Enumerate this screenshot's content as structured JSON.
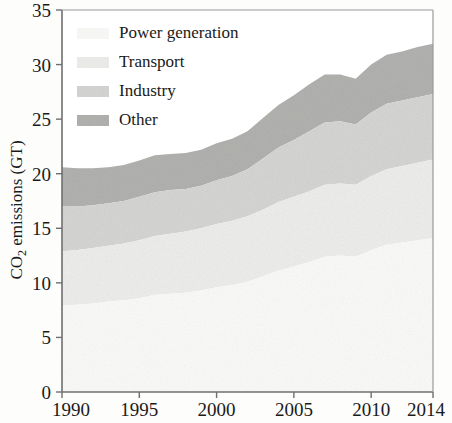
{
  "figure": {
    "background_color": "#fdfdfc",
    "frame_color": "#6f6f6f"
  },
  "axes": {
    "y_title": "CO",
    "y_title_sub": "2",
    "y_title_rest": " emissions (GT)",
    "y_title_full": "CO2 emissions (GT)",
    "y_ticks": [
      "0",
      "5",
      "10",
      "15",
      "20",
      "25",
      "30",
      "35"
    ],
    "x_ticks": [
      "1990",
      "1995",
      "2000",
      "2005",
      "2010",
      "2014"
    ]
  },
  "legend": {
    "items": [
      {
        "label": "Power generation",
        "color": "#fbfbfa"
      },
      {
        "label": "Transport",
        "color": "#eeeeec"
      },
      {
        "label": "Industry",
        "color": "#d6d6d4"
      },
      {
        "label": "Other",
        "color": "#b2b2b0"
      }
    ]
  },
  "chart_data": {
    "type": "area",
    "title": "",
    "xlabel": "",
    "ylabel": "CO2 emissions (GT)",
    "xlim": [
      1990,
      2014
    ],
    "ylim": [
      0,
      35
    ],
    "grid": false,
    "stacked": true,
    "legend_position": "upper-left",
    "x": [
      1990,
      1991,
      1992,
      1993,
      1994,
      1995,
      1996,
      1997,
      1998,
      1999,
      2000,
      2001,
      2002,
      2003,
      2004,
      2005,
      2006,
      2007,
      2008,
      2009,
      2010,
      2011,
      2012,
      2013,
      2014
    ],
    "series": [
      {
        "name": "Power generation",
        "color": "#fbfbfa",
        "values": [
          7.9,
          8.0,
          8.1,
          8.3,
          8.4,
          8.6,
          8.9,
          9.0,
          9.1,
          9.3,
          9.6,
          9.8,
          10.1,
          10.6,
          11.1,
          11.5,
          11.9,
          12.4,
          12.5,
          12.4,
          13.0,
          13.5,
          13.7,
          13.9,
          14.1
        ]
      },
      {
        "name": "Transport",
        "color": "#eeeeec",
        "values": [
          5.0,
          5.0,
          5.1,
          5.1,
          5.2,
          5.3,
          5.4,
          5.5,
          5.6,
          5.7,
          5.8,
          5.9,
          6.0,
          6.1,
          6.3,
          6.4,
          6.5,
          6.6,
          6.6,
          6.6,
          6.8,
          6.9,
          7.0,
          7.1,
          7.2
        ]
      },
      {
        "name": "Industry",
        "color": "#d6d6d4",
        "values": [
          4.1,
          4.0,
          3.9,
          3.9,
          3.9,
          4.0,
          4.0,
          4.0,
          3.9,
          3.9,
          4.0,
          4.1,
          4.3,
          4.7,
          5.0,
          5.2,
          5.5,
          5.7,
          5.7,
          5.5,
          5.8,
          6.0,
          6.0,
          6.0,
          6.0
        ]
      },
      {
        "name": "Other",
        "color": "#b2b2b0",
        "values": [
          3.6,
          3.5,
          3.4,
          3.3,
          3.3,
          3.3,
          3.4,
          3.3,
          3.3,
          3.3,
          3.4,
          3.4,
          3.5,
          3.7,
          3.9,
          4.1,
          4.3,
          4.4,
          4.3,
          4.2,
          4.4,
          4.5,
          4.5,
          4.6,
          4.6
        ]
      }
    ],
    "totals": [
      20.6,
      20.5,
      20.5,
      20.6,
      20.8,
      21.2,
      21.7,
      21.8,
      21.9,
      22.2,
      22.8,
      23.2,
      23.9,
      25.1,
      26.3,
      27.2,
      28.2,
      29.1,
      29.1,
      28.7,
      30.0,
      30.9,
      31.2,
      31.6,
      31.9
    ]
  }
}
